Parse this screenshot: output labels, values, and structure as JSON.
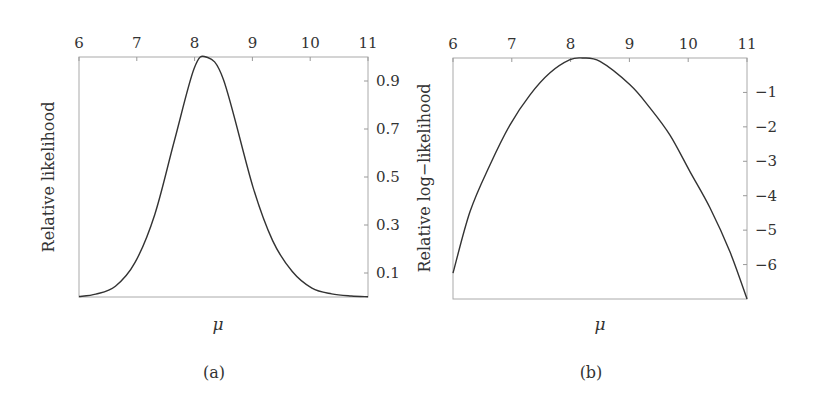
{
  "chart_data": [
    {
      "type": "line",
      "panel": "(a)",
      "title": "",
      "xlabel": "μ",
      "ylabel": "Relative likelihood",
      "xlim": [
        6,
        11
      ],
      "ylim": [
        0,
        1
      ],
      "x_ticks": [
        "6",
        "7",
        "8",
        "9",
        "10",
        "11"
      ],
      "x_axis_position": "top",
      "y_ticks": [
        "0.1",
        "0.3",
        "0.5",
        "0.7",
        "0.9"
      ],
      "y_axis_position": "right",
      "grid": false,
      "series": [
        {
          "name": "relative likelihood",
          "x": [
            6.0,
            6.29,
            6.63,
            6.97,
            7.31,
            7.65,
            7.99,
            8.2,
            8.5,
            9.01,
            9.35,
            9.69,
            10.03,
            10.37,
            10.71,
            11.0
          ],
          "values": [
            0.002,
            0.012,
            0.045,
            0.144,
            0.343,
            0.651,
            0.951,
            1.0,
            0.905,
            0.458,
            0.235,
            0.106,
            0.037,
            0.013,
            0.004,
            0.001
          ]
        }
      ]
    },
    {
      "type": "line",
      "panel": "(b)",
      "title": "",
      "xlabel": "μ",
      "ylabel": "Relative log−likelihood",
      "xlim": [
        6,
        11
      ],
      "ylim": [
        -7,
        0
      ],
      "x_ticks": [
        "6",
        "7",
        "8",
        "9",
        "10",
        "11"
      ],
      "x_axis_position": "top",
      "y_ticks": [
        "−1",
        "−2",
        "−3",
        "−4",
        "−5",
        "−6"
      ],
      "y_axis_position": "right",
      "grid": false,
      "series": [
        {
          "name": "relative log-likelihood",
          "x": [
            6.0,
            6.29,
            6.63,
            6.97,
            7.31,
            7.65,
            7.99,
            8.2,
            8.5,
            9.01,
            9.35,
            9.69,
            10.03,
            10.37,
            10.71,
            11.0
          ],
          "values": [
            -6.25,
            -4.46,
            -3.1,
            -1.94,
            -1.07,
            -0.43,
            -0.05,
            0.0,
            -0.1,
            -0.78,
            -1.45,
            -2.24,
            -3.3,
            -4.35,
            -5.63,
            -7.0
          ]
        }
      ]
    }
  ],
  "panels": {
    "a": {
      "caption": "(a)",
      "ylabel": "Relative likelihood",
      "xlabel": "μ"
    },
    "b": {
      "caption": "(b)",
      "ylabel": "Relative log−likelihood",
      "xlabel": "μ"
    }
  },
  "style": {
    "line_color": "#333333",
    "frame_color": "#aaaaaa"
  }
}
